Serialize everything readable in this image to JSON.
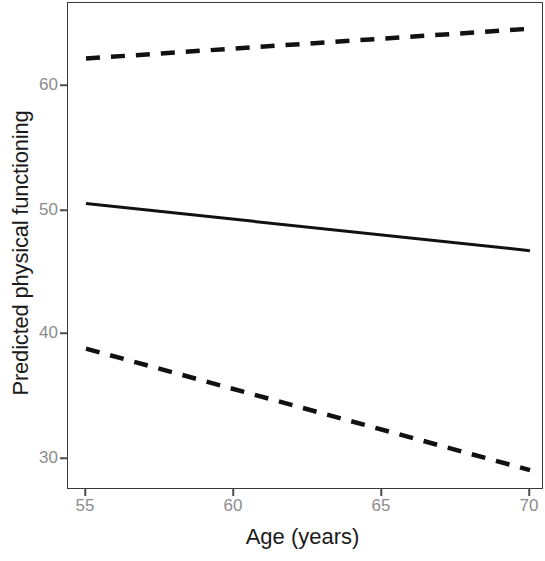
{
  "chart_data": {
    "type": "line",
    "title": "",
    "subtitle": "",
    "xlabel": "Age (years)",
    "ylabel": "Predicted physical functioning",
    "x": [
      55,
      70
    ],
    "xlim": [
      53.6,
      70.8
    ],
    "ylim": [
      27.4,
      65.6
    ],
    "xticks": [
      55,
      60,
      65,
      70
    ],
    "xtick_labels": [
      "55",
      "60",
      "65",
      "70"
    ],
    "yticks": [
      30,
      40,
      50,
      60
    ],
    "ytick_labels": [
      "30",
      "40",
      "50",
      "60"
    ],
    "grid": false,
    "legend": "none",
    "annotations": [],
    "series": [
      {
        "name": "Upper 95% confidence limit",
        "style": "dashed",
        "color": "#111111",
        "x": [
          55,
          70
        ],
        "values": [
          62.3,
          64.7
        ]
      },
      {
        "name": "Predicted mean",
        "style": "solid",
        "color": "#111111",
        "x": [
          55,
          70
        ],
        "values": [
          50.6,
          46.8
        ]
      },
      {
        "name": "Lower 95% confidence limit",
        "style": "dashed",
        "color": "#111111",
        "x": [
          55,
          70
        ],
        "values": [
          38.9,
          29.1
        ]
      }
    ]
  },
  "axes": {
    "x_title": "Age (years)",
    "y_title": "Predicted physical functioning",
    "x_tick_0": "55",
    "x_tick_1": "60",
    "x_tick_2": "65",
    "x_tick_3": "70",
    "y_tick_0": "30",
    "y_tick_1": "40",
    "y_tick_2": "50",
    "y_tick_3": "60"
  },
  "colors": {
    "line": "#111111",
    "axis": "#3a3a3a",
    "tick_label": "#8c8c8c",
    "axis_title": "#1a1a1a",
    "panel_background": "#ffffff"
  }
}
